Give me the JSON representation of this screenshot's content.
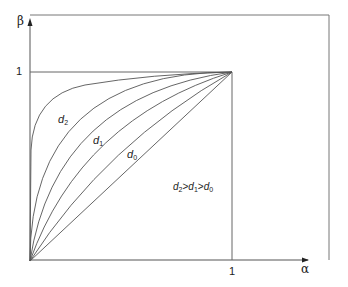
{
  "diagram": {
    "axes": {
      "x_label": "α",
      "y_label": "β",
      "x_tick": "1",
      "y_tick": "1"
    },
    "curves": [
      {
        "name": "d0",
        "label_base": "d",
        "label_sub": "0",
        "shape": "straight diagonal"
      },
      {
        "name": "d1",
        "label_base": "d",
        "label_sub": "1",
        "shape": "concave"
      },
      {
        "name": "d2",
        "label_base": "d",
        "label_sub": "2",
        "shape": "strongly concave"
      }
    ],
    "legend": {
      "parts": [
        {
          "base": "d",
          "sub": "2"
        },
        {
          "sep": ">"
        },
        {
          "base": "d",
          "sub": "1"
        },
        {
          "sep": ">"
        },
        {
          "base": "d",
          "sub": "0"
        }
      ]
    },
    "colors": {
      "line": "#555555",
      "text": "#222222"
    }
  }
}
